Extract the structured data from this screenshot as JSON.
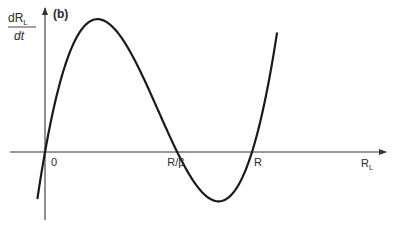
{
  "chart_data": {
    "type": "line",
    "panel_label": "(b)",
    "ylabel": {
      "numerator": "dR",
      "numerator_sub": "L",
      "denominator": "dt"
    },
    "xlabel": {
      "main": "R",
      "sub": "L"
    },
    "x_ticks": [
      {
        "label": "0",
        "value": 0
      },
      {
        "label": "R/β",
        "value": 0.53
      },
      {
        "label": "R",
        "value": 0.83
      }
    ],
    "curve": {
      "description": "cubic dR_L/dt with roots at 0, R/beta and R",
      "roots": [
        0,
        0.53,
        0.83
      ],
      "x_range": [
        -0.03,
        0.93
      ],
      "local_max": {
        "x": 0.23,
        "y": 0.9
      },
      "local_min": {
        "x": 0.7,
        "y": -0.34
      }
    },
    "axis_ranges": {
      "x": [
        -0.15,
        1.0
      ],
      "y": [
        -0.45,
        1.0
      ]
    },
    "grid": false,
    "legend": "none",
    "line_color": "#1a1a1a",
    "axis_color": "#333333"
  }
}
